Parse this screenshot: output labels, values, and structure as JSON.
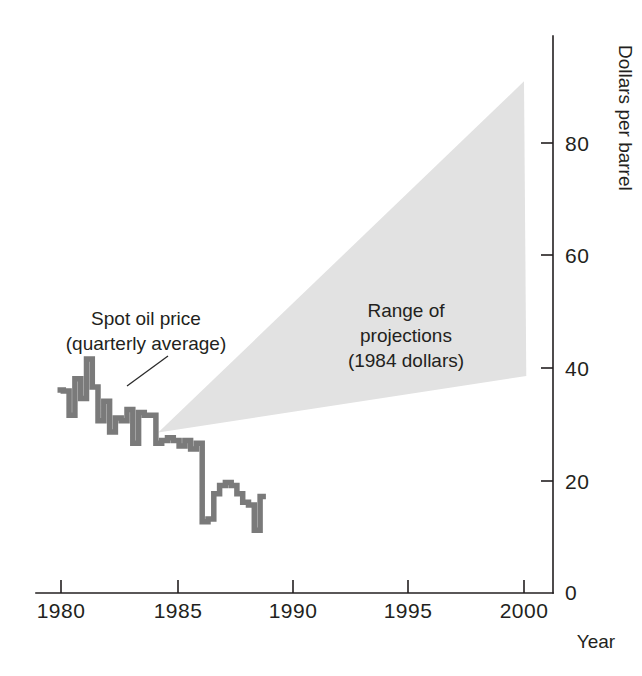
{
  "chart_data": {
    "type": "line",
    "title": "",
    "subtitle": "",
    "xlabel": "Year",
    "ylabel": "Dollars per barrel",
    "xlim": [
      1979.5,
      2001.2
    ],
    "ylim": [
      0,
      92
    ],
    "grid": false,
    "legend_position": "none",
    "x_ticks": [
      1980,
      1985,
      1990,
      1995,
      2000
    ],
    "x_tick_labels": [
      "1980",
      "1985",
      "1990",
      "1995",
      "2000"
    ],
    "y_ticks": [
      0,
      20,
      40,
      60,
      80
    ],
    "y_tick_labels": [
      "0",
      "20",
      "40",
      "60",
      "80"
    ],
    "y_axis_side": "right",
    "series": [
      {
        "name": "Spot oil price (quarterly average)",
        "type": "line",
        "color": "#7a7a7a",
        "x": [
          1979.85,
          1980.1,
          1980.35,
          1980.6,
          1980.85,
          1981.1,
          1981.35,
          1981.6,
          1981.85,
          1982.1,
          1982.35,
          1982.6,
          1982.85,
          1983.1,
          1983.35,
          1983.6,
          1983.85,
          1984.1,
          1984.35,
          1984.6,
          1984.85,
          1985.1,
          1985.35,
          1985.6,
          1985.85,
          1986.1,
          1986.35,
          1986.6,
          1986.85,
          1987.1,
          1987.35,
          1987.6,
          1987.85,
          1988.1,
          1988.35,
          1988.6
        ],
        "y": [
          36.0,
          35.8,
          31.5,
          38.0,
          34.5,
          41.5,
          36.5,
          30.5,
          34.0,
          28.5,
          31.0,
          30.5,
          32.5,
          26.5,
          32.0,
          31.5,
          31.5,
          26.5,
          27.0,
          27.5,
          27.0,
          26.0,
          27.0,
          25.5,
          26.5,
          12.5,
          13.0,
          17.5,
          19.0,
          19.5,
          19.0,
          17.5,
          16.0,
          15.5,
          11.0,
          17.0
        ]
      }
    ],
    "bands": [
      {
        "name": "Range of projections (1984 dollars)",
        "color": "#e2e2e2",
        "apex": {
          "x": 1984.2,
          "y": 28.4
        },
        "upper_end": {
          "x": 2000.0,
          "y": 91.0
        },
        "lower_end": {
          "x": 2000.1,
          "y": 38.5
        }
      }
    ],
    "annotations": [
      {
        "id": "spot-price-label",
        "lines": [
          "Spot oil price",
          "(quarterly average)"
        ],
        "x_px": 146,
        "y_px": 325,
        "anchor": "middle",
        "leader": {
          "x1": 168,
          "y1": 350,
          "x2": 129,
          "y2": 382
        }
      },
      {
        "id": "projection-range-label",
        "lines": [
          "Range of",
          "projections",
          "(1984 dollars)"
        ],
        "x_px": 406,
        "y_px": 317,
        "anchor": "middle",
        "leader": null
      }
    ]
  },
  "axes": {
    "x_axis_title": "Year",
    "y_axis_title": "Dollars per barrel"
  }
}
